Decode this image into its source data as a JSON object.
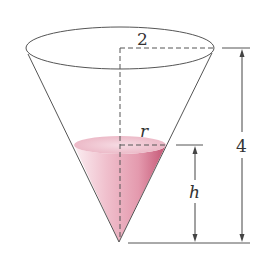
{
  "diagram": {
    "labels": {
      "top_radius": "2",
      "total_height": "4",
      "water_radius": "r",
      "water_height": "h"
    },
    "colors": {
      "line": "#555555",
      "water_light": "#f4d3dc",
      "water_mid": "#e8a7b8",
      "water_dark": "#c85a78"
    }
  }
}
